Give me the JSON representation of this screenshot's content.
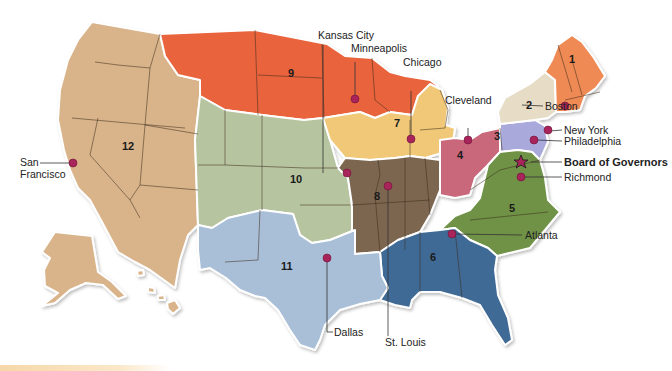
{
  "map": {
    "title": "Federal Reserve Districts",
    "colors": {
      "d1": "#ef8a55",
      "d2": "#e7dcc6",
      "d3": "#a9a9dc",
      "d4": "#c8687a",
      "d5": "#6f9247",
      "d6": "#3f6b96",
      "d7": "#f0c877",
      "d8": "#7b6650",
      "d9": "#e9643d",
      "d10": "#b7c4a0",
      "d11": "#a9bfd8",
      "d12": "#d9b48a",
      "pin": "#a8245a"
    },
    "districts": [
      {
        "number": "1"
      },
      {
        "number": "2"
      },
      {
        "number": "3"
      },
      {
        "number": "4"
      },
      {
        "number": "5"
      },
      {
        "number": "6"
      },
      {
        "number": "7"
      },
      {
        "number": "8"
      },
      {
        "number": "9"
      },
      {
        "number": "10"
      },
      {
        "number": "11"
      },
      {
        "number": "12"
      }
    ],
    "cities": {
      "boston": "Boston",
      "new_york": "New York",
      "philadelphia": "Philadelphia",
      "board": "Board of Governors",
      "richmond": "Richmond",
      "atlanta": "Atlanta",
      "cleveland": "Cleveland",
      "chicago": "Chicago",
      "minneapolis": "Minneapolis",
      "kansas_city": "Kansas City",
      "st_louis": "St. Louis",
      "dallas": "Dallas",
      "san_francisco_1": "San",
      "san_francisco_2": "Francisco"
    }
  }
}
